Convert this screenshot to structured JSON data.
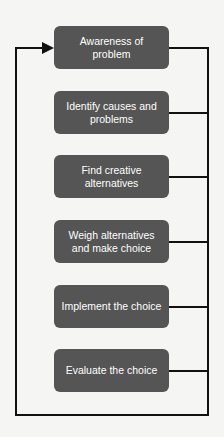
{
  "diagram": {
    "type": "cyclic-flowchart",
    "steps": [
      {
        "label": "Awareness of problem"
      },
      {
        "label": "Identify causes and problems"
      },
      {
        "label": "Find creative alternatives"
      },
      {
        "label": "Weigh alternatives and make choice"
      },
      {
        "label": "Implement the choice"
      },
      {
        "label": "Evaluate the choice"
      }
    ],
    "colors": {
      "box_fill": "#555555",
      "box_text": "#ffffff",
      "line": "#111111",
      "background": "#f5f5f3"
    },
    "feedback_loop": "All steps connect to right vertical line which loops to bottom, left side, and back with arrow into first step"
  }
}
